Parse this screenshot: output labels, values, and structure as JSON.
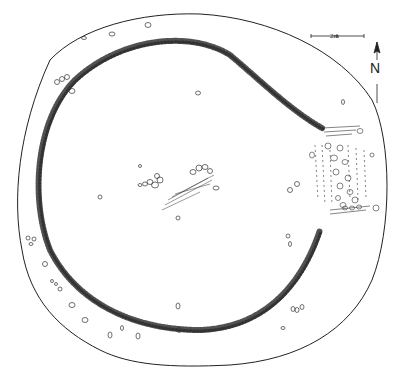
{
  "figure": {
    "type": "archaeological site plan",
    "colors": {
      "ink": "#222222",
      "background": "#ffffff"
    }
  },
  "scale_bar": {
    "label": "2m"
  },
  "north_arrow": {
    "label": "N"
  },
  "features": [
    {
      "name": "outer-bank-outline"
    },
    {
      "name": "stone-ring-wall"
    },
    {
      "name": "entrance-passage-east"
    },
    {
      "name": "central-stone-cluster"
    },
    {
      "name": "scattered-stones"
    }
  ]
}
